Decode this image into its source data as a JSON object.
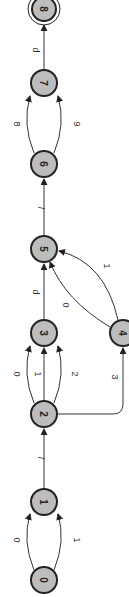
{
  "diagram": {
    "type": "finite-automaton",
    "orientation": "rotated-90",
    "states": [
      {
        "id": "0",
        "label": "0",
        "accepting": false
      },
      {
        "id": "1",
        "label": "1",
        "accepting": false
      },
      {
        "id": "2",
        "label": "2",
        "accepting": false
      },
      {
        "id": "3",
        "label": "3",
        "accepting": false
      },
      {
        "id": "4",
        "label": "4",
        "accepting": false
      },
      {
        "id": "5",
        "label": "5",
        "accepting": false
      },
      {
        "id": "6",
        "label": "6",
        "accepting": false
      },
      {
        "id": "7",
        "label": "7",
        "accepting": false
      },
      {
        "id": "8",
        "label": "8",
        "accepting": true
      }
    ],
    "transitions": [
      {
        "from": "0",
        "to": "1",
        "label": "0"
      },
      {
        "from": "0",
        "to": "1",
        "label": "1"
      },
      {
        "from": "1",
        "to": "2",
        "label": "/"
      },
      {
        "from": "2",
        "to": "3",
        "label": "0"
      },
      {
        "from": "2",
        "to": "3",
        "label": "1"
      },
      {
        "from": "2",
        "to": "3",
        "label": "2"
      },
      {
        "from": "2",
        "to": "4",
        "label": "3"
      },
      {
        "from": "3",
        "to": "5",
        "label": "d"
      },
      {
        "from": "4",
        "to": "5",
        "label": "0"
      },
      {
        "from": "4",
        "to": "5",
        "label": "1"
      },
      {
        "from": "5",
        "to": "6",
        "label": "/"
      },
      {
        "from": "6",
        "to": "7",
        "label": "8"
      },
      {
        "from": "6",
        "to": "7",
        "label": "9"
      },
      {
        "from": "7",
        "to": "8",
        "label": "d"
      }
    ]
  }
}
